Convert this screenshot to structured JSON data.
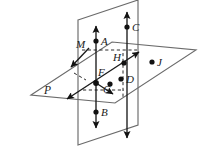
{
  "figure": {
    "canvas": {
      "width": 201,
      "height": 158
    },
    "background_color": "#ffffff",
    "ink_color": "#1a1a1a",
    "plane_edge_color": "#6b6b6b",
    "dash_color": "#2b2b2b"
  },
  "labels": {
    "point_a": "A",
    "point_b": "B",
    "point_c": "C",
    "point_d": "D",
    "point_f": "F",
    "point_g": "G",
    "point_h": "H",
    "point_j": "J",
    "plane_m": "M",
    "plane_p": "P"
  },
  "points": [
    {
      "name": "A",
      "label": "A",
      "x": 96,
      "y": 41,
      "label_x": 101,
      "label_y": 45
    },
    {
      "name": "B",
      "label": "B",
      "x": 96,
      "y": 112,
      "label_x": 101,
      "label_y": 116
    },
    {
      "name": "C",
      "label": "C",
      "x": 127,
      "y": 27,
      "label_x": 132,
      "label_y": 31
    },
    {
      "name": "D",
      "label": "D",
      "x": 121,
      "y": 79,
      "label_x": 126,
      "label_y": 83
    },
    {
      "name": "F",
      "label": "F",
      "x": 96,
      "y": 83,
      "label_x": 99,
      "label_y": 75
    },
    {
      "name": "G",
      "label": "G",
      "x": 110,
      "y": 84,
      "label_x": 105,
      "label_y": 84
    },
    {
      "name": "H",
      "label": "H",
      "x": 124,
      "y": 63,
      "label_x": 114,
      "label_y": 61
    },
    {
      "name": "J",
      "label": "J",
      "x": 152,
      "y": 62,
      "label_x": 157,
      "label_y": 66
    }
  ],
  "plane_labels": [
    {
      "name": "M",
      "label": "M",
      "label_x": 78,
      "label_y": 47
    },
    {
      "name": "P",
      "label": "P",
      "label_x": 46,
      "label_y": 93
    }
  ],
  "vertical_plane": {
    "name": "vertical-plane",
    "outline": "78,20 138,0 138,125 78,145"
  },
  "horizontal_plane": {
    "name": "horizontal-plane",
    "outline": "31,95 112,42 196,50 115,103"
  },
  "rays": [
    {
      "name": "ray-through-a-b",
      "x1": 96,
      "y1": 26,
      "x2": 96,
      "y2": 128,
      "arrow_start": true,
      "arrow_end": true
    },
    {
      "name": "ray-through-c-d",
      "x1": 127,
      "y1": 12,
      "x2": 127,
      "y2": 138,
      "arrow_start": true,
      "arrow_end": true
    },
    {
      "name": "ray-diagonal-f",
      "x1": 66,
      "y1": 99,
      "x2": 139,
      "y2": 52,
      "arrow_start": true,
      "arrow_end": true
    },
    {
      "name": "ray-to-g",
      "x1": 96,
      "y1": 83,
      "x2": 114,
      "y2": 95,
      "arrow_start": false,
      "arrow_end": true
    },
    {
      "name": "ray-intersection-down",
      "x1": 88,
      "y1": 49,
      "x2": 70,
      "y2": 68,
      "arrow_start": false,
      "arrow_end": true
    }
  ],
  "dashed_segments": [
    {
      "name": "dash-top-horizontal",
      "x1": 82,
      "y1": 50,
      "x2": 137,
      "y2": 50
    },
    {
      "name": "dash-vertical-right",
      "x1": 123,
      "y1": 53,
      "x2": 123,
      "y2": 97
    },
    {
      "name": "dash-bottom-horizontal",
      "x1": 82,
      "y1": 90,
      "x2": 124,
      "y2": 90
    },
    {
      "name": "dash-diagonal-short",
      "x1": 74,
      "y1": 73,
      "x2": 85,
      "y2": 80
    }
  ]
}
